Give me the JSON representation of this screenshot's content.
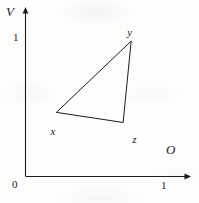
{
  "figure": {
    "background_color": "#fdfdfc",
    "ink_color": "#1c1c1c",
    "width": 199,
    "height": 203
  },
  "axes": {
    "vertical": {
      "name": "V",
      "origin_label": "0",
      "tick_label": "1"
    },
    "horizontal": {
      "name": "O",
      "tick_label": "1"
    }
  },
  "vertices": {
    "x": "x",
    "y": "y",
    "z": "z"
  },
  "chart_data": {
    "type": "scatter",
    "title": "",
    "xlabel": "O",
    "ylabel": "V",
    "xlim": [
      0,
      1.22
    ],
    "ylim": [
      0,
      1.22
    ],
    "xticks": [
      0,
      1
    ],
    "xticklabels": [
      "0",
      "1"
    ],
    "yticks": [
      0,
      1
    ],
    "yticklabels": [
      "0",
      "1"
    ],
    "grid": false,
    "legend": null,
    "annotations": [
      {
        "label": "x",
        "x": 0.223,
        "y": 0.463,
        "label_position": "below-left"
      },
      {
        "label": "y",
        "x": 0.763,
        "y": 0.978,
        "label_position": "above"
      },
      {
        "label": "z",
        "x": 0.705,
        "y": 0.39,
        "label_position": "right"
      }
    ],
    "series": [
      {
        "name": "triangle xyz",
        "closed": true,
        "points": [
          {
            "label": "x",
            "x": 0.223,
            "y": 0.463
          },
          {
            "label": "y",
            "x": 0.763,
            "y": 0.978
          },
          {
            "label": "z",
            "x": 0.705,
            "y": 0.39
          }
        ]
      }
    ]
  }
}
